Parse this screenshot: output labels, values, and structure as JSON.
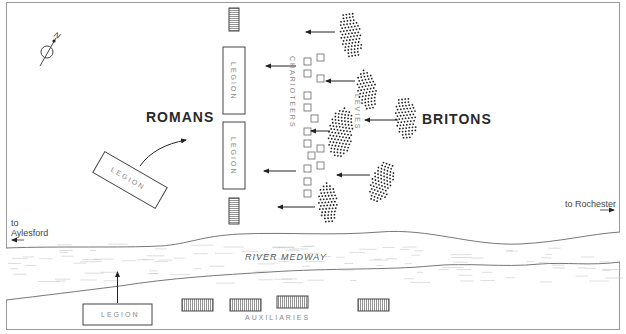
{
  "compass": {
    "label": "N",
    "icon": "north-arrow-icon"
  },
  "sides": {
    "romans": "ROMANS",
    "britons": "BRITONS"
  },
  "units": {
    "legion_top": "LEGION",
    "legion_middle": "LEGION",
    "legion_reserve": "LEGION",
    "legion_south": "LEGION",
    "auxiliaries": "AUXILIARIES",
    "chariots": "CHARIOTEERS",
    "levies": "LEVIES"
  },
  "river": {
    "name": "RIVER MEDWAY"
  },
  "places": {
    "west_to": "to",
    "west_name": "Aylesford",
    "east": "to Rochester"
  },
  "colors": {
    "ink": "#333333",
    "frame": "#9a9a9a",
    "light_ink": "#888888",
    "water": "#bdbdbd"
  },
  "british_clusters": [
    {
      "cx": 351,
      "cy": 35,
      "rx": 10,
      "ry": 24,
      "rot": -8
    },
    {
      "cx": 367,
      "cy": 90,
      "rx": 9,
      "ry": 20,
      "rot": -10
    },
    {
      "cx": 341,
      "cy": 133,
      "rx": 12,
      "ry": 25,
      "rot": 8
    },
    {
      "cx": 406,
      "cy": 118,
      "rx": 10,
      "ry": 22,
      "rot": -6
    },
    {
      "cx": 382,
      "cy": 182,
      "rx": 10,
      "ry": 22,
      "rot": 20
    },
    {
      "cx": 328,
      "cy": 203,
      "rx": 9,
      "ry": 20,
      "rot": -4
    }
  ],
  "chariot_squares": [
    [
      304,
      58
    ],
    [
      317,
      54
    ],
    [
      304,
      70
    ],
    [
      317,
      75
    ],
    [
      304,
      92
    ],
    [
      304,
      104
    ],
    [
      311,
      115
    ],
    [
      304,
      128
    ],
    [
      304,
      140
    ],
    [
      317,
      145
    ],
    [
      308,
      152
    ],
    [
      304,
      165
    ],
    [
      317,
      162
    ],
    [
      304,
      178
    ],
    [
      304,
      190
    ]
  ],
  "arrows": [
    {
      "x1": 335,
      "y1": 32,
      "x2": 306,
      "y2": 32
    },
    {
      "x1": 296,
      "y1": 66,
      "x2": 266,
      "y2": 66
    },
    {
      "x1": 355,
      "y1": 81,
      "x2": 326,
      "y2": 81
    },
    {
      "x1": 398,
      "y1": 120,
      "x2": 365,
      "y2": 120
    },
    {
      "x1": 330,
      "y1": 131,
      "x2": 311,
      "y2": 131
    },
    {
      "x1": 296,
      "y1": 171,
      "x2": 264,
      "y2": 171
    },
    {
      "x1": 370,
      "y1": 175,
      "x2": 337,
      "y2": 175
    },
    {
      "x1": 315,
      "y1": 207,
      "x2": 278,
      "y2": 207
    }
  ]
}
